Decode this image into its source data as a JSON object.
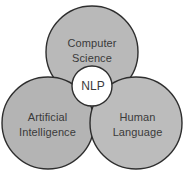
{
  "diagram": {
    "type": "venn-3-circle",
    "colors": {
      "circle_fill": "#b9b9b9",
      "circle_fill_alt": "#b3b3b3",
      "circle_stroke": "#2e2e2e",
      "center_fill": "#ffffff",
      "center_stroke": "#2e2e2e",
      "text": "#3a3a3a",
      "background": "#ffffff"
    },
    "circles": [
      {
        "id": "computer-science",
        "label_line1": "Computer",
        "label_line2": "Science",
        "cx": 92,
        "cy": 52,
        "r": 46
      },
      {
        "id": "artificial-intelligence",
        "label_line1": "Artificial",
        "label_line2": "Intelligence",
        "cx": 48,
        "cy": 123,
        "r": 46
      },
      {
        "id": "human-language",
        "label_line1": "Human",
        "label_line2": "Language",
        "cx": 136,
        "cy": 123,
        "r": 46
      }
    ],
    "center": {
      "id": "nlp",
      "label": "NLP",
      "cx": 92,
      "cy": 86,
      "r": 20
    }
  }
}
